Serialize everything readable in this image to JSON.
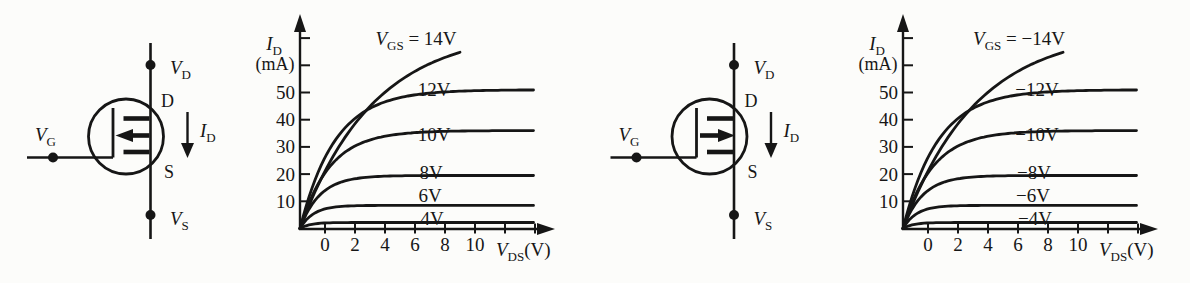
{
  "figure": {
    "background": "#fcfcfa",
    "ink": "#161616"
  },
  "circuits": [
    {
      "kind": "n-channel-mosfet",
      "arrow_direction": "in",
      "drain_terminal": {
        "main": "V",
        "sub": "D"
      },
      "gate_terminal": {
        "main": "V",
        "sub": "G"
      },
      "source_terminal": {
        "main": "V",
        "sub": "S"
      },
      "drain_pin": "D",
      "source_pin": "S",
      "current_label": {
        "main": "I",
        "sub": "D"
      }
    },
    {
      "kind": "p-channel-mosfet",
      "arrow_direction": "out",
      "drain_terminal": {
        "main": "V",
        "sub": "D"
      },
      "gate_terminal": {
        "main": "V",
        "sub": "G"
      },
      "source_terminal": {
        "main": "V",
        "sub": "S"
      },
      "drain_pin": "D",
      "source_pin": "S",
      "current_label": {
        "main": "I",
        "sub": "D"
      }
    }
  ],
  "chart_data": [
    {
      "type": "line",
      "title": "n-channel MOSFET output characteristics",
      "xlabel": {
        "main": "V",
        "sub": "DS",
        "unit": "(V)"
      },
      "ylabel": {
        "main": "I",
        "sub": "D",
        "unit": "(mA)"
      },
      "x_ticks_labeled": [
        0,
        2,
        4,
        6,
        8,
        10
      ],
      "x_ticks_unlabeled": [
        12,
        14
      ],
      "y_ticks_labeled": [
        10,
        20,
        30,
        40,
        50
      ],
      "y_ticks_unlabeled": [
        60,
        70
      ],
      "xlim": [
        0,
        15
      ],
      "ylim": [
        0,
        78
      ],
      "grid": false,
      "legend_position": "labels-on-curves",
      "series": [
        {
          "label": "14V",
          "label_prefix": {
            "main": "V",
            "sub": "GS",
            "eq": " = "
          },
          "i_sat_mA": 73,
          "v_knee_V": 13.0,
          "v_end_V": 9.0,
          "label_offset": [
            116,
            45
          ]
        },
        {
          "label": "12V",
          "i_sat_mA": 51,
          "v_knee_V": 5.3,
          "v_end_V": 13.9,
          "label_offset": [
            134,
            96
          ]
        },
        {
          "label": "10V",
          "i_sat_mA": 36,
          "v_knee_V": 4.3,
          "v_end_V": 13.9,
          "label_offset": [
            134,
            141
          ]
        },
        {
          "label": "8V",
          "i_sat_mA": 19.5,
          "v_knee_V": 2.3,
          "v_end_V": 13.9,
          "label_offset": [
            131,
            179
          ]
        },
        {
          "label": "6V",
          "i_sat_mA": 8.5,
          "v_knee_V": 1.0,
          "v_end_V": 13.9,
          "label_offset": [
            130,
            202
          ]
        },
        {
          "label": "4V",
          "i_sat_mA": 2.2,
          "v_knee_V": 0.3,
          "v_end_V": 13.9,
          "label_offset": [
            132,
            225
          ]
        }
      ]
    },
    {
      "type": "line",
      "title": "p-channel MOSFET output characteristics",
      "xlabel": {
        "main": "V",
        "sub": "DS",
        "unit": "(V)"
      },
      "ylabel": {
        "main": "I",
        "sub": "D",
        "unit": "(mA)"
      },
      "x_ticks_labeled": [
        0,
        2,
        4,
        6,
        8,
        10
      ],
      "x_ticks_unlabeled": [
        12,
        14
      ],
      "y_ticks_labeled": [
        10,
        20,
        30,
        40,
        50
      ],
      "y_ticks_unlabeled": [
        60,
        70
      ],
      "xlim": [
        0,
        15
      ],
      "ylim": [
        0,
        78
      ],
      "grid": false,
      "legend_position": "labels-on-curves",
      "series": [
        {
          "label": "−14V",
          "label_prefix": {
            "main": "V",
            "sub": "GS",
            "eq": " = "
          },
          "i_sat_mA": 73,
          "v_knee_V": 13.0,
          "v_end_V": 9.0,
          "label_offset": [
            116,
            45
          ]
        },
        {
          "label": "−12V",
          "i_sat_mA": 51,
          "v_knee_V": 5.3,
          "v_end_V": 13.9,
          "label_offset": [
            134,
            96
          ]
        },
        {
          "label": "−10V",
          "i_sat_mA": 36,
          "v_knee_V": 4.3,
          "v_end_V": 13.9,
          "label_offset": [
            134,
            141
          ]
        },
        {
          "label": "−8V",
          "i_sat_mA": 19.5,
          "v_knee_V": 2.3,
          "v_end_V": 13.9,
          "label_offset": [
            131,
            179
          ]
        },
        {
          "label": "−6V",
          "i_sat_mA": 8.5,
          "v_knee_V": 1.0,
          "v_end_V": 13.9,
          "label_offset": [
            130,
            202
          ]
        },
        {
          "label": "−4V",
          "i_sat_mA": 2.2,
          "v_knee_V": 0.3,
          "v_end_V": 13.9,
          "label_offset": [
            132,
            225
          ]
        }
      ]
    }
  ]
}
